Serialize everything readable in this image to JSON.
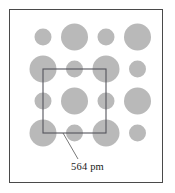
{
  "figure": {
    "frame": {
      "x": 9,
      "y": 9,
      "width": 154,
      "height": 174,
      "stroke_color": "#4a4a4a",
      "stroke_width": 1,
      "background_color": "#ffffff"
    }
  },
  "dimension": {
    "value": "564",
    "unit": "pm",
    "label": "564 pm",
    "text_color": "#1a1a1a"
  },
  "leader_line": {
    "from_x": 78,
    "from_y": 159,
    "to_x": 63,
    "to_y": 133,
    "stroke_color": "#555555",
    "stroke_width": 0.8
  },
  "unit_cell": {
    "x": 43,
    "y": 69,
    "width": 63,
    "height": 64,
    "stroke_color": "#54545c",
    "stroke_width": 1.1,
    "fill": "none"
  },
  "chart_data": {
    "type": "scatter",
    "xlabel": "",
    "ylabel": "",
    "annotations": [
      "564 pm"
    ],
    "legend": [
      {
        "name": "large-ion",
        "radius": 13.5,
        "color": "#b9b9b9"
      },
      {
        "name": "small-ion",
        "radius": 8.5,
        "color": "#b9b9b9"
      }
    ],
    "lattice": {
      "rows": 4,
      "columns": 4,
      "spacing_x": 31.5,
      "spacing_y": 32,
      "origin_x": 43,
      "origin_y": 37,
      "pattern": "alternating-checkerboard",
      "large_radius": 13.5,
      "small_radius": 8.5,
      "circle_fill": "#b9b9b9"
    },
    "points": [
      {
        "x": 43,
        "y": 37,
        "size": "small"
      },
      {
        "x": 74.5,
        "y": 37,
        "size": "large"
      },
      {
        "x": 106,
        "y": 37,
        "size": "small"
      },
      {
        "x": 137.5,
        "y": 37,
        "size": "large"
      },
      {
        "x": 43,
        "y": 69,
        "size": "large"
      },
      {
        "x": 74.5,
        "y": 69,
        "size": "small"
      },
      {
        "x": 106,
        "y": 69,
        "size": "large"
      },
      {
        "x": 137.5,
        "y": 69,
        "size": "small"
      },
      {
        "x": 43,
        "y": 101,
        "size": "small"
      },
      {
        "x": 74.5,
        "y": 101,
        "size": "large"
      },
      {
        "x": 106,
        "y": 101,
        "size": "small"
      },
      {
        "x": 137.5,
        "y": 101,
        "size": "large"
      },
      {
        "x": 43,
        "y": 133,
        "size": "large"
      },
      {
        "x": 74.5,
        "y": 133,
        "size": "small"
      },
      {
        "x": 106,
        "y": 133,
        "size": "large"
      },
      {
        "x": 137.5,
        "y": 133,
        "size": "small"
      }
    ]
  }
}
